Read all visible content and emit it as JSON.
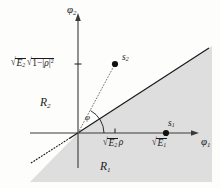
{
  "figure": {
    "type": "signal-space-constellation-diagram",
    "axes": {
      "x_label": "φ₁",
      "x_label_parts": {
        "symbol": "φ",
        "sub": "1"
      },
      "y_label": "φ₂",
      "y_label_parts": {
        "symbol": "φ",
        "sub": "2"
      },
      "x_axis_arrow": true,
      "y_axis_arrow": true
    },
    "y_tick_label": {
      "text": "√E₂ √(1−|ρ|²)",
      "radical1_radicand": "E",
      "radical1_sub": "2",
      "radical2_radicand": "1−|ρ|²"
    },
    "x_tick_labels": [
      {
        "id": "sqrt-e2-rho",
        "text": "√E₂ ρ",
        "radicand": "E",
        "sub": "2",
        "trailing": "ρ"
      },
      {
        "id": "sqrt-e1",
        "text": "√E₁",
        "radicand": "E",
        "sub": "1",
        "trailing": ""
      }
    ],
    "points": [
      {
        "id": "s1",
        "label": "s₁",
        "symbol": "s",
        "sub": "1",
        "marker": "filled-circle"
      },
      {
        "id": "s2",
        "label": "s₂",
        "symbol": "s",
        "sub": "2",
        "marker": "filled-circle"
      }
    ],
    "regions": [
      {
        "id": "R1",
        "label": "R₁",
        "symbol": "R",
        "sub": "1",
        "shaded": true
      },
      {
        "id": "R2",
        "label": "R₂",
        "symbol": "R",
        "sub": "2",
        "shaded": false
      }
    ],
    "angle": {
      "label": "φ",
      "symbol": "φ",
      "marker": "arc"
    },
    "lines": [
      {
        "id": "decision-boundary",
        "style": "solid",
        "note": "region separator"
      },
      {
        "id": "boundary-extension",
        "style": "dotted",
        "note": "lower-left extension"
      },
      {
        "id": "origin-to-s2",
        "style": "dotted",
        "note": "vector to s2"
      }
    ],
    "colors": {
      "ink": "#1a1a1a",
      "axis": "#3a3a3a",
      "shade": "#dedede",
      "background": "#fdfdfc"
    }
  }
}
